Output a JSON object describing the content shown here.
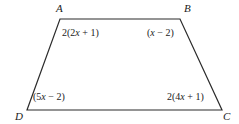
{
  "figure": {
    "type": "quadrilateral-trapezoid",
    "stroke_color": "#2b2b2b",
    "background_color": "#ffffff",
    "stroke_width": 1.2,
    "vertices": [
      {
        "name": "A",
        "label": "A",
        "x": 60,
        "y": 19,
        "position": "top-left"
      },
      {
        "name": "B",
        "label": "B",
        "x": 180,
        "y": 19,
        "position": "top-right"
      },
      {
        "name": "C",
        "label": "C",
        "x": 222,
        "y": 110,
        "position": "bottom-right"
      },
      {
        "name": "D",
        "label": "D",
        "x": 27,
        "y": 110,
        "position": "bottom-left"
      }
    ],
    "angle_labels": {
      "at_A": {
        "full": "2(2x + 1)",
        "prefix": "2(2",
        "variable": "x",
        "suffix": " + 1)"
      },
      "at_B": {
        "full": "(x − 2)",
        "prefix": "(",
        "variable": "x",
        "suffix": " − 2)"
      },
      "at_D": {
        "full": "(5x − 2)",
        "prefix": "(5",
        "variable": "x",
        "suffix": " − 2)"
      },
      "at_C": {
        "full": "2(4x + 1)",
        "prefix": "2(4",
        "variable": "x",
        "suffix": " + 1)"
      }
    },
    "path": "M 60 19 L 180 19 L 222 110 L 27 110 Z"
  }
}
